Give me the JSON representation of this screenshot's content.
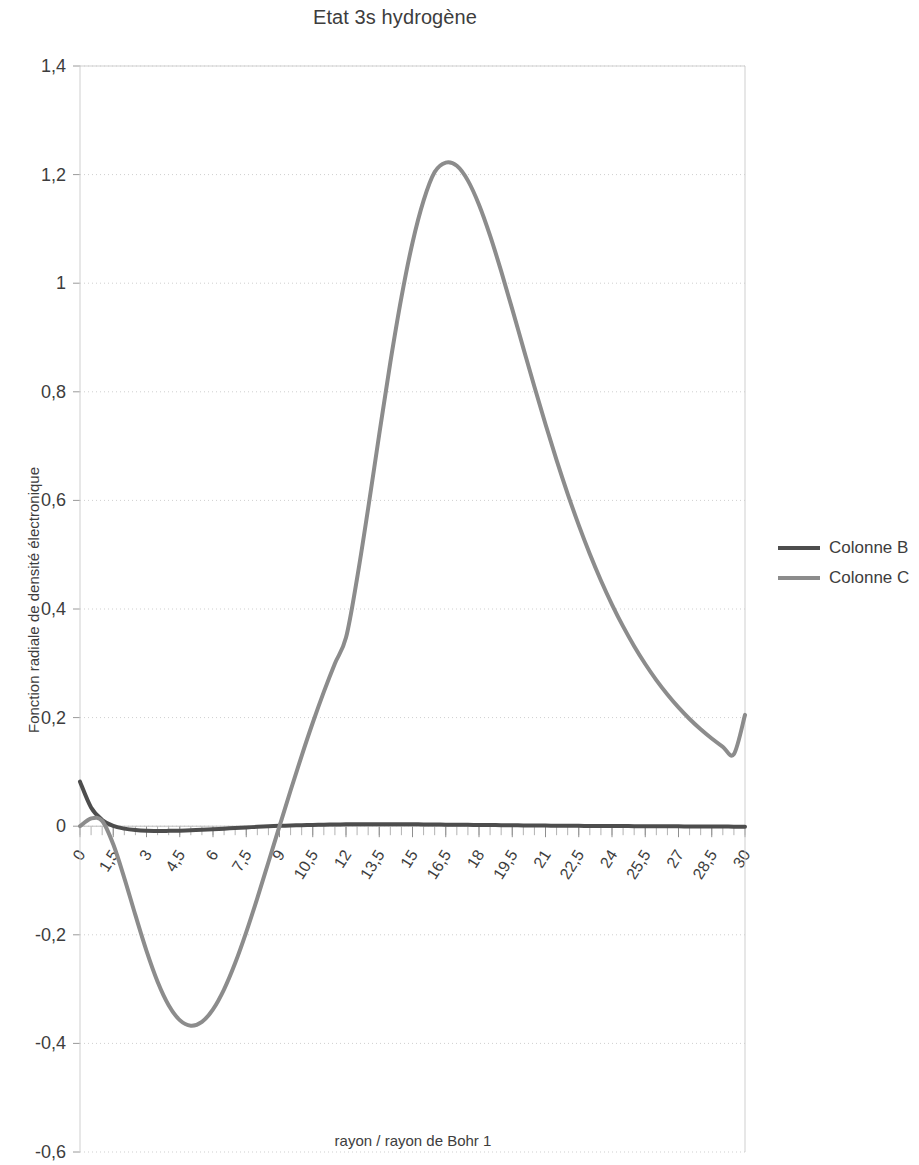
{
  "chart_data": {
    "type": "line",
    "title": "Etat 3s hydrogène",
    "xlabel": "rayon / rayon de Bohr 1",
    "ylabel": "Fonction radiale de densité électronique",
    "xlim": [
      0,
      30
    ],
    "ylim": [
      -0.6,
      1.4
    ],
    "grid": true,
    "legend_position": "right",
    "xticks": [
      "0",
      "1,5",
      "3",
      "4,5",
      "6",
      "7,5",
      "9",
      "10,5",
      "12",
      "13,5",
      "15",
      "16,5",
      "18",
      "19,5",
      "21",
      "22,5",
      "24",
      "25,5",
      "27",
      "28,5",
      "30"
    ],
    "yticks": [
      "1,4",
      "1,2",
      "1",
      "0,8",
      "0,6",
      "0,4",
      "0,2",
      "0",
      "-0,2",
      "-0,4",
      "-0,6"
    ],
    "x": [
      0,
      0.5,
      1,
      1.5,
      2,
      2.5,
      3,
      3.5,
      4,
      4.5,
      5,
      5.5,
      6,
      6.5,
      7,
      7.5,
      8,
      8.5,
      9,
      9.5,
      10,
      10.5,
      11,
      11.5,
      12,
      12.5,
      13,
      13.5,
      14,
      14.5,
      15,
      15.5,
      16,
      16.5,
      17,
      17.5,
      18,
      18.5,
      19,
      19.5,
      20,
      20.5,
      21,
      21.5,
      22,
      22.5,
      23,
      23.5,
      24,
      24.5,
      25,
      25.5,
      26,
      26.5,
      27,
      27.5,
      28,
      28.5,
      29,
      29.5,
      30
    ],
    "series": [
      {
        "name": "Colonne B",
        "color": "#4d4d4d",
        "values": [
          0.082,
          0.0345,
          0.0115,
          0.0005,
          -0.0045,
          -0.0072,
          -0.0085,
          -0.0088,
          -0.0086,
          -0.0082,
          -0.0075,
          -0.0066,
          -0.0056,
          -0.0045,
          -0.0034,
          -0.0022,
          -0.0012,
          -0.0002,
          0.0006,
          0.0013,
          0.0019,
          0.0024,
          0.0028,
          0.0032,
          0.0034,
          0.0036,
          0.0037,
          0.0037,
          0.0037,
          0.0036,
          0.0035,
          0.0033,
          0.0031,
          0.0029,
          0.0027,
          0.0025,
          0.0023,
          0.0021,
          0.0019,
          0.0017,
          0.0015,
          0.0013,
          0.0011,
          0.0009,
          0.0008,
          0.0006,
          0.0005,
          0.0004,
          0.0003,
          0.0002,
          0.0001,
          0.0,
          -0.0001,
          -0.0002,
          -0.0003,
          -0.0004,
          -0.0005,
          -0.0006,
          -0.0007,
          -0.0008,
          -0.0009
        ]
      },
      {
        "name": "Colonne C",
        "color": "#8c8c8c",
        "values": [
          0.0,
          0.0142,
          0.0098,
          -0.0334,
          -0.0955,
          -0.1639,
          -0.2296,
          -0.2863,
          -0.3296,
          -0.3571,
          -0.3673,
          -0.3603,
          -0.3374,
          -0.3005,
          -0.2521,
          -0.1951,
          -0.1323,
          -0.0664,
          0.0,
          0.0658,
          0.1297,
          0.1905,
          0.2474,
          0.2998,
          0.3473,
          0.4565,
          0.5855,
          0.7217,
          0.8542,
          0.9739,
          1.0746,
          1.1521,
          1.2046,
          1.2222,
          1.2162,
          1.1889,
          1.1445,
          1.0875,
          1.0222,
          0.9522,
          0.8805,
          0.8093,
          0.7402,
          0.6742,
          0.6122,
          0.5545,
          0.5013,
          0.4526,
          0.4082,
          0.3679,
          0.3315,
          0.2987,
          0.2691,
          0.2426,
          0.2188,
          0.1975,
          0.1785,
          0.1615,
          0.1463,
          0.1328,
          0.205
        ]
      }
    ]
  },
  "legend": {
    "entries": [
      {
        "label": "Colonne B"
      },
      {
        "label": "Colonne C"
      }
    ]
  }
}
